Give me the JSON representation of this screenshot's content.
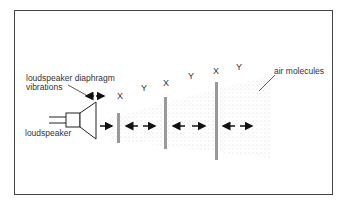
{
  "labels": {
    "diaphragm_line1": "loudspeaker diaphragm",
    "diaphragm_line2": "vibrations",
    "loudspeaker": "loudspeaker",
    "air_molecules": "air molecules"
  },
  "regions": [
    {
      "label": "X",
      "type": "compression"
    },
    {
      "label": "Y",
      "type": "rarefaction"
    },
    {
      "label": "X",
      "type": "compression"
    },
    {
      "label": "Y",
      "type": "rarefaction"
    },
    {
      "label": "X",
      "type": "compression"
    },
    {
      "label": "Y",
      "type": "rarefaction"
    }
  ],
  "legend": {
    "X": "compression",
    "Y": "rarefaction"
  }
}
